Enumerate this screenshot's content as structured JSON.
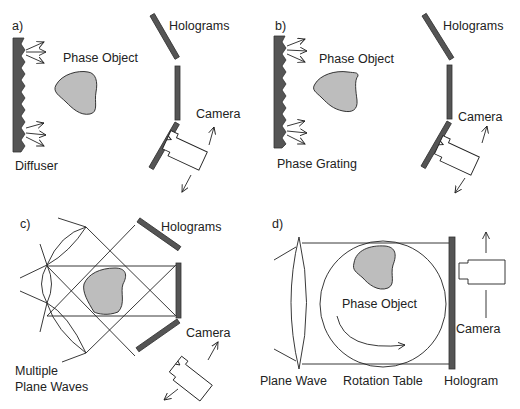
{
  "panels": {
    "a": {
      "label": "a)",
      "source_label": "Diffuser",
      "object_label": "Phase Object",
      "holograms_label": "Holograms",
      "camera_label": "Camera"
    },
    "b": {
      "label": "b)",
      "source_label": "Phase Grating",
      "object_label": "Phase Object",
      "holograms_label": "Holograms",
      "camera_label": "Camera"
    },
    "c": {
      "label": "c)",
      "source_label_line1": "Multiple",
      "source_label_line2": "Plane Waves",
      "holograms_label": "Holograms",
      "camera_label": "Camera"
    },
    "d": {
      "label": "d)",
      "object_label": "Phase Object",
      "source_label": "Plane Wave",
      "table_label": "Rotation Table",
      "hologram_label": "Hologram",
      "camera_label": "Camera"
    }
  },
  "colors": {
    "plate": "#555555",
    "object_fill": "#bdbdbd",
    "line": "#222222",
    "background": "#ffffff"
  }
}
